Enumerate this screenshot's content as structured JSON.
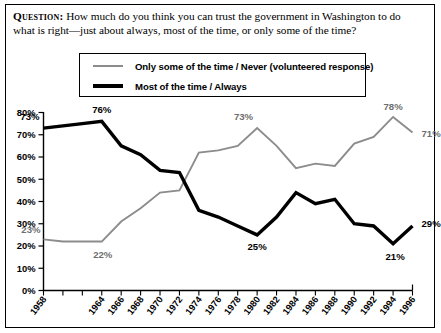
{
  "question": {
    "label": "Question:",
    "text": " How much do you think you can trust the government in Washington to do what is right—just about always, most of the time, or only some of the time?"
  },
  "legend": {
    "items": [
      {
        "label": "Only some of the time / Never (volunteered response)",
        "color": "#8c8c8c",
        "style": "thin",
        "name": "some-never"
      },
      {
        "label": "Most of the time / Always",
        "color": "#000000",
        "style": "thick",
        "name": "most-always"
      }
    ]
  },
  "axis": {
    "y_ticks": [
      "0%",
      "10%",
      "20%",
      "30%",
      "40%",
      "50%",
      "60%",
      "70%",
      "80%"
    ],
    "x_ticks": [
      "1958",
      "",
      "",
      "1964",
      "1966",
      "1968",
      "1970",
      "1972",
      "1974",
      "1976",
      "1978",
      "1980",
      "1982",
      "1984",
      "1986",
      "1988",
      "1990",
      "1992",
      "1994",
      "1996"
    ]
  },
  "chart_data": {
    "type": "line",
    "title": "",
    "xlabel": "",
    "ylabel": "",
    "ylim": [
      0,
      80
    ],
    "grid": false,
    "legend_position": "top",
    "x": [
      1958,
      1960,
      1962,
      1964,
      1966,
      1968,
      1970,
      1972,
      1974,
      1976,
      1978,
      1980,
      1982,
      1984,
      1986,
      1988,
      1990,
      1992,
      1994,
      1996
    ],
    "series": [
      {
        "name": "Most of the time / Always",
        "color": "#000000",
        "values": [
          73,
          74,
          75,
          76,
          65,
          61,
          54,
          53,
          36,
          33,
          29,
          25,
          33,
          44,
          39,
          41,
          30,
          29,
          21,
          29
        ],
        "labels": [
          {
            "x": 1958,
            "value": 73,
            "text": "73%"
          },
          {
            "x": 1964,
            "value": 76,
            "text": "76%"
          },
          {
            "x": 1980,
            "value": 25,
            "text": "25%"
          },
          {
            "x": 1994,
            "value": 21,
            "text": "21%"
          },
          {
            "x": 1996,
            "value": 29,
            "text": "29%"
          }
        ]
      },
      {
        "name": "Only some of the time / Never (volunteered response)",
        "color": "#8c8c8c",
        "values": [
          23,
          22,
          22,
          22,
          31,
          37,
          44,
          45,
          62,
          63,
          65,
          73,
          65,
          55,
          57,
          56,
          66,
          69,
          78,
          71
        ],
        "labels": [
          {
            "x": 1958,
            "value": 23,
            "text": "23%"
          },
          {
            "x": 1964,
            "value": 22,
            "text": "22%"
          },
          {
            "x": 1980,
            "value": 73,
            "text": "73%"
          },
          {
            "x": 1994,
            "value": 78,
            "text": "78%"
          },
          {
            "x": 1996,
            "value": 71,
            "text": "71%"
          }
        ]
      }
    ]
  }
}
